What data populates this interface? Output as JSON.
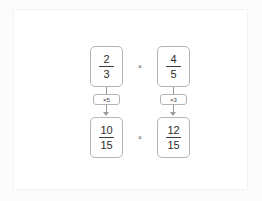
{
  "diagram": {
    "colors": {
      "panel_background": "#ffffff",
      "canvas_background": "#fcfcfc",
      "box_border": "#b4b4b4",
      "connector": "#9a9a9a",
      "text": "#2b2b2b"
    },
    "top_row": {
      "operator": "×",
      "fractions": [
        {
          "numerator": "2",
          "denominator": "3"
        },
        {
          "numerator": "4",
          "denominator": "5"
        }
      ]
    },
    "connectors": [
      {
        "label": "×5",
        "direction": "down"
      },
      {
        "label": "×3",
        "direction": "down"
      }
    ],
    "bottom_row": {
      "operator": "×",
      "fractions": [
        {
          "numerator": "10",
          "denominator": "15"
        },
        {
          "numerator": "12",
          "denominator": "15"
        }
      ]
    }
  }
}
